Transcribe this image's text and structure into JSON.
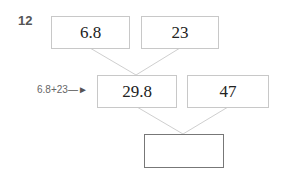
{
  "problem": {
    "number": "12",
    "top_row": [
      "6.8",
      "23"
    ],
    "middle_row": [
      "29.8",
      "47"
    ],
    "answer": "",
    "hint": "6.8+23",
    "arrow_icon": "right-arrow-icon"
  }
}
